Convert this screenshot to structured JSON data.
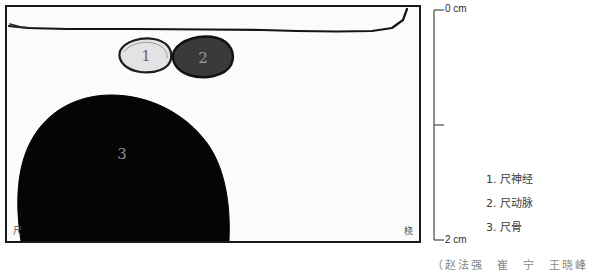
{
  "figure": {
    "type": "ultrasound-line-diagram",
    "region": "ulnar forearm cross-section"
  },
  "panel": {
    "background_color": "#fbfbfb",
    "border_color": "#1a1a1a",
    "orientation_left": "尺",
    "orientation_right": "桡",
    "skin_line_color": "#111111"
  },
  "structures": [
    {
      "number": "1",
      "name": "尺神经",
      "fill": "#e0e0e0",
      "outline": "#1c1c1c",
      "label_color": "#6b6b6b"
    },
    {
      "number": "2",
      "name": "尺动脉",
      "fill": "#3a3a3a",
      "outline": "#111111",
      "label_color": "#9a9a9a"
    },
    {
      "number": "3",
      "name": "尺骨",
      "fill": "#050505",
      "outline": "#000000",
      "label_color": "#8c8c8c"
    }
  ],
  "scale": {
    "top_label": "0 cm",
    "bottom_label": "2 cm",
    "mid_tick": "1 cm",
    "line_color": "#555555"
  },
  "legend": {
    "items": [
      {
        "text": "1. 尺神经"
      },
      {
        "text": "2. 尺动脉"
      },
      {
        "text": "3. 尺骨"
      }
    ]
  },
  "caption": {
    "text": "（赵法强　崔　宁　王晓峰"
  }
}
